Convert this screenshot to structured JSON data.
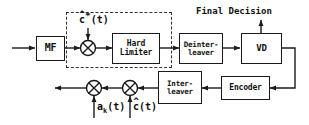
{
  "diagram": {
    "background_color": "#ffffff",
    "line_color": "#1a1a1a",
    "dashed_box_color": "#333333"
  },
  "blocks": {
    "mf": {
      "label": "MF"
    },
    "hard_limiter": {
      "line1": "Hard",
      "line2": "Limiter"
    },
    "deinterleaver": {
      "line1": "Deinter-",
      "line2": "leaver"
    },
    "vd": {
      "label": "VD"
    },
    "encoder": {
      "label": "Encoder"
    },
    "interleaver": {
      "line1": "Inter-",
      "line2": "leaver"
    }
  },
  "labels": {
    "final_decision": "Final Decision",
    "c_star_hat": {
      "hat": "^",
      "base": "c",
      "star": "*",
      "arg": "(t)"
    },
    "a_k": {
      "base": "a",
      "sub": "k",
      "arg": "(t)"
    },
    "c_hat": {
      "hat": "^",
      "base": "c",
      "arg": "(t)"
    }
  },
  "nodes": {
    "mixer_top": {
      "name": "multiplier"
    },
    "mixer_bottom_left": {
      "name": "multiplier"
    },
    "mixer_bottom_right": {
      "name": "multiplier"
    }
  }
}
